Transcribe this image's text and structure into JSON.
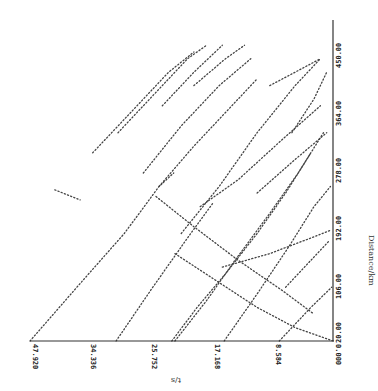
{
  "chart_data": {
    "type": "scatter",
    "title": "",
    "orientation": "rotated 90 degrees (time axis horizontal at bottom, reversed; distance axis vertical on right)",
    "xlabel": "t/s",
    "ylabel": "Distance/km",
    "x_ticks": [
      "47.920",
      "34.336",
      "25.752",
      "17.168",
      "8.584",
      "0.000"
    ],
    "y_ticks": [
      "20.00",
      "106.00",
      "192.00",
      "278.00",
      "364.00",
      "450.00"
    ],
    "xlim": [
      47.92,
      0.0
    ],
    "ylim": [
      20.0,
      450.0
    ],
    "grid": false,
    "legend": null,
    "series": [
      {
        "name": "line-1",
        "points": [
          [
            47.92,
            20
          ],
          [
            40.5,
            100
          ],
          [
            33.0,
            180
          ],
          [
            27.5,
            250
          ],
          [
            25.2,
            270
          ]
        ]
      },
      {
        "name": "line-2",
        "points": [
          [
            34.3,
            20
          ],
          [
            28.5,
            100
          ],
          [
            22.5,
            180
          ],
          [
            19.0,
            225
          ]
        ]
      },
      {
        "name": "line-3",
        "points": [
          [
            25.5,
            20
          ],
          [
            21.5,
            70
          ],
          [
            17.0,
            120
          ],
          [
            12.0,
            180
          ],
          [
            7.5,
            240
          ],
          [
            3.5,
            300
          ]
        ]
      },
      {
        "name": "line-4",
        "points": [
          [
            25.0,
            20
          ],
          [
            20.0,
            80
          ],
          [
            15.5,
            140
          ],
          [
            10.0,
            210
          ],
          [
            5.5,
            270
          ],
          [
            1.5,
            330
          ]
        ]
      },
      {
        "name": "line-5",
        "points": [
          [
            17.2,
            20
          ],
          [
            12.0,
            90
          ],
          [
            7.0,
            160
          ],
          [
            3.0,
            220
          ],
          [
            0.4,
            250
          ]
        ]
      },
      {
        "name": "line-6",
        "points": [
          [
            0.0,
            20
          ],
          [
            6.0,
            40
          ],
          [
            12.0,
            70
          ],
          [
            18.5,
            110
          ],
          [
            25.0,
            150
          ]
        ]
      },
      {
        "name": "line-7",
        "points": [
          [
            8.5,
            20
          ],
          [
            3.5,
            70
          ],
          [
            0.2,
            100
          ]
        ]
      },
      {
        "name": "line-8",
        "points": [
          [
            27.5,
            250
          ],
          [
            22.0,
            310
          ],
          [
            17.0,
            360
          ],
          [
            12.0,
            410
          ]
        ]
      },
      {
        "name": "line-9",
        "points": [
          [
            30.0,
            270
          ],
          [
            24.0,
            340
          ],
          [
            18.0,
            400
          ],
          [
            13.0,
            440
          ]
        ]
      },
      {
        "name": "line-10",
        "points": [
          [
            24.0,
            180
          ],
          [
            18.0,
            250
          ],
          [
            12.0,
            330
          ],
          [
            6.0,
            400
          ],
          [
            2.0,
            440
          ]
        ]
      },
      {
        "name": "line-11",
        "points": [
          [
            38.0,
            300
          ],
          [
            32.0,
            360
          ],
          [
            26.0,
            420
          ],
          [
            22.0,
            450
          ]
        ]
      },
      {
        "name": "line-12",
        "points": [
          [
            34.0,
            330
          ],
          [
            28.0,
            390
          ],
          [
            23.0,
            440
          ],
          [
            20.0,
            460
          ]
        ]
      },
      {
        "name": "line-13",
        "points": [
          [
            27.0,
            370
          ],
          [
            22.0,
            420
          ],
          [
            17.5,
            460
          ]
        ]
      },
      {
        "name": "line-14",
        "points": [
          [
            22.0,
            400
          ],
          [
            17.0,
            440
          ],
          [
            14.0,
            460
          ]
        ]
      },
      {
        "name": "line-15",
        "points": [
          [
            21.0,
            220
          ],
          [
            15.0,
            260
          ],
          [
            8.0,
            320
          ],
          [
            2.0,
            370
          ]
        ]
      },
      {
        "name": "line-16",
        "points": [
          [
            6.5,
            330
          ],
          [
            3.0,
            380
          ],
          [
            1.0,
            420
          ]
        ]
      },
      {
        "name": "line-17",
        "points": [
          [
            12.0,
            240
          ],
          [
            6.0,
            290
          ],
          [
            1.0,
            330
          ]
        ]
      },
      {
        "name": "line-18",
        "points": [
          [
            17.5,
            130
          ],
          [
            10.0,
            150
          ],
          [
            3.0,
            175
          ],
          [
            0.3,
            185
          ]
        ]
      },
      {
        "name": "line-19",
        "points": [
          [
            44.0,
            245
          ],
          [
            40.0,
            230
          ]
        ]
      },
      {
        "name": "line-20",
        "points": [
          [
            28.0,
            235
          ],
          [
            22.0,
            190
          ],
          [
            15.0,
            140
          ],
          [
            8.0,
            95
          ],
          [
            3.0,
            60
          ]
        ]
      },
      {
        "name": "line-21",
        "points": [
          [
            10.0,
            400
          ],
          [
            6.0,
            420
          ],
          [
            2.0,
            440
          ]
        ]
      },
      {
        "name": "line-22",
        "points": [
          [
            7.5,
            100
          ],
          [
            3.5,
            140
          ],
          [
            0.5,
            170
          ]
        ]
      }
    ]
  },
  "axes": {
    "x_title": "t/s",
    "y_title": "Distance/km",
    "x_ticks": [
      "47.920",
      "34.336",
      "25.752",
      "17.168",
      "8.584",
      "0.000"
    ],
    "y_ticks": [
      "20.00",
      "106.00",
      "192.00",
      "278.00",
      "364.00",
      "450.00"
    ]
  }
}
